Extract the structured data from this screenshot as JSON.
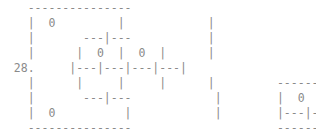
{
  "figure": {
    "kind": "ascii-grid-art",
    "background_color": "#ffffff",
    "glyph_color": "#8a8a8a",
    "label_color": "#7d7d7d",
    "columns": 54,
    "rows": 9,
    "row_label": "28.",
    "cell_values": [
      "0",
      "0",
      "0",
      "0",
      "0"
    ],
    "left_box": {
      "name": "main-grid",
      "top_border": "-------------",
      "cells_top": "0",
      "cells_middle_left": "0",
      "cells_middle_right": "0",
      "cells_bottom": "0",
      "divider": "|---|---|---|---|"
    },
    "right_box": {
      "name": "secondary-grid",
      "top_border": "-------",
      "cell": "0",
      "divider": "|---|---|",
      "bottom_border": "-------"
    }
  },
  "ascii_rows": [
    "   -------------",
    "   | 0        |        |",
    "   |     ---|---       |",
    "   |     | 0 | 0 |     |",
    " 28.     |---|---|---|---|",
    "   |     |   |   |   |       -------",
    "   |     ---|---     |       | 0 |  |",
    "   | 0       |       |       |---|---|",
    "   -------------             -------"
  ],
  "grid_lines": [
    {
      "id": "row-0",
      "text": "    ---------------"
    },
    {
      "id": "row-1",
      "text": "    |  0         |            |"
    },
    {
      "id": "row-2",
      "text": "    |       ---|---           |"
    },
    {
      "id": "row-3",
      "text": "    |      |  0  |  0  |      |"
    },
    {
      "id": "row-4",
      "text": "  28.     |---|---|---|---|"
    },
    {
      "id": "row-5",
      "text": "    |      |     |     |      |         --------"
    },
    {
      "id": "row-6",
      "text": "    |       ---|---            |        |  0  |     |"
    },
    {
      "id": "row-7",
      "text": "    |  0          |            |        |---|---|"
    },
    {
      "id": "row-8",
      "text": "    ---------------                     --------"
    }
  ]
}
